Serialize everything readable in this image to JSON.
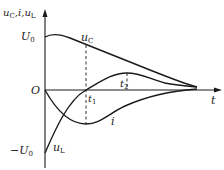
{
  "diagram": {
    "axes": {
      "y_label": "u_C, i, u_L",
      "x_label": "t",
      "origin_label": "O",
      "y_top_label": "U_0",
      "y_bottom_label": "-U_0"
    },
    "curves": [
      {
        "name": "u_C",
        "label": "u_C",
        "description": "starts at U_0, decays to 0, inflection at t_1"
      },
      {
        "name": "i",
        "label": "i",
        "description": "starts at 0, dips negative, minimum at t_1, returns to 0"
      },
      {
        "name": "u_L",
        "label": "u_L",
        "description": "starts at -U_0, crosses zero at t_1, peaks at t_2, decays to 0"
      }
    ],
    "markers": [
      {
        "label": "t_1",
        "position": "t1"
      },
      {
        "label": "t_2",
        "position": "t2"
      }
    ],
    "colors": {
      "line": "#1a1a1a",
      "background": "#ffffff"
    }
  },
  "labels": {
    "y_axis_main": "u",
    "y_axis_sub1": "C",
    "y_axis_sep1": ",i,",
    "y_axis_main2": "u",
    "y_axis_sub2": "L",
    "U0": "U",
    "U0_sub": "0",
    "negU0": "−U",
    "negU0_sub": "0",
    "origin": "O",
    "t": "t",
    "t1": "t",
    "t1_sub": "1",
    "t2": "t",
    "t2_sub": "2",
    "uC": "u",
    "uC_sub": "C",
    "i": "i",
    "uL": "u",
    "uL_sub": "L"
  }
}
